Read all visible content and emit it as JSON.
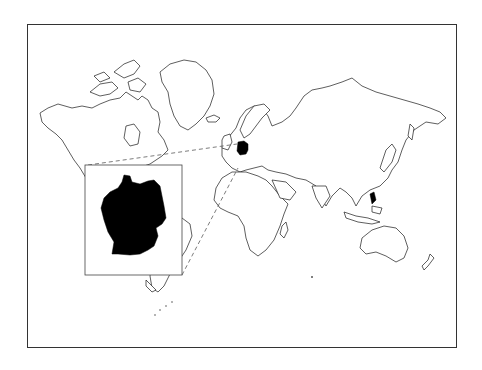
{
  "map": {
    "projection": "Mercator world map",
    "highlighted_country": "Germany",
    "highlight_color": "#000000",
    "land_fill": "#ffffff",
    "coastline_color": "#1a1a1a",
    "frame_color": "#333333",
    "inset": {
      "subject": "Germany",
      "fill": "#000000",
      "border_color": "#444444"
    },
    "leader_lines": "dashed"
  }
}
